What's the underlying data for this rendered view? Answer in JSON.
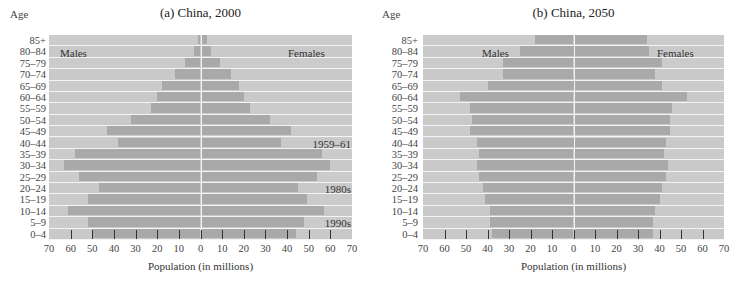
{
  "chart_data": [
    {
      "type": "bar",
      "subtype": "population-pyramid",
      "title": "(a) China, 2000",
      "ylabel": "Age",
      "xlabel": "Population (in millions)",
      "categories": [
        "85+",
        "80–84",
        "75–79",
        "70–74",
        "65–69",
        "60–64",
        "55–59",
        "50–54",
        "45–49",
        "40–44",
        "35–39",
        "30–34",
        "25–29",
        "20–24",
        "15–19",
        "10–14",
        "5–9",
        "0–4"
      ],
      "series": [
        {
          "name": "Males",
          "values": [
            1,
            3,
            7,
            12,
            18,
            20,
            23,
            32,
            43,
            38,
            58,
            63,
            56,
            47,
            52,
            61,
            52,
            50
          ]
        },
        {
          "name": "Females",
          "values": [
            3,
            5,
            9,
            14,
            18,
            20,
            23,
            32,
            42,
            37,
            56,
            60,
            54,
            45,
            49,
            57,
            48,
            44
          ]
        }
      ],
      "xticks": [
        70,
        60,
        50,
        40,
        30,
        20,
        10,
        0,
        10,
        20,
        30,
        40,
        50,
        60,
        70
      ],
      "xlim": [
        -70,
        70
      ],
      "legend": {
        "left": "Males",
        "right": "Females"
      },
      "annotations": [
        {
          "text": "1959–61",
          "row": "40–44"
        },
        {
          "text": "1980s",
          "row": "20–24"
        },
        {
          "text": "1990s",
          "row": "5–9"
        }
      ]
    },
    {
      "type": "bar",
      "subtype": "population-pyramid",
      "title": "(b) China, 2050",
      "ylabel": "Age",
      "xlabel": "Population (in millions)",
      "categories": [
        "85+",
        "80–84",
        "75–79",
        "70–74",
        "65–69",
        "60–64",
        "55–59",
        "50–54",
        "45–49",
        "40–44",
        "35–39",
        "30–34",
        "25–29",
        "20–24",
        "15–19",
        "10–14",
        "5–9",
        "0–4"
      ],
      "series": [
        {
          "name": "Males",
          "values": [
            18,
            25,
            33,
            33,
            40,
            53,
            48,
            47,
            48,
            45,
            44,
            45,
            44,
            42,
            41,
            39,
            39,
            38
          ]
        },
        {
          "name": "Females",
          "values": [
            34,
            35,
            41,
            38,
            41,
            53,
            46,
            45,
            45,
            43,
            42,
            44,
            43,
            41,
            40,
            38,
            37,
            37
          ]
        }
      ],
      "xticks": [
        70,
        60,
        50,
        40,
        30,
        20,
        10,
        0,
        10,
        20,
        30,
        40,
        50,
        60,
        70
      ],
      "xlim": [
        -70,
        70
      ],
      "legend": {
        "left": "Males",
        "right": "Females"
      },
      "annotations": []
    }
  ],
  "colors": {
    "band": "#c9c9c9",
    "bar": "#a9a9a9",
    "separator": "#f4f4f4",
    "text": "#333333"
  }
}
